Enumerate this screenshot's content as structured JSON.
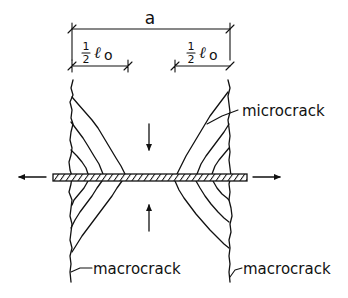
{
  "figure": {
    "type": "crack-pattern-schematic",
    "dimensions": {
      "total_width_label": "a",
      "left_zone": {
        "numerator": "1",
        "denominator": "2",
        "symbol": "ℓ",
        "subscript": "o"
      },
      "right_zone": {
        "numerator": "1",
        "denominator": "2",
        "symbol": "ℓ",
        "subscript": "o"
      }
    },
    "labels": {
      "microcrack": "microcrack",
      "macrocrack_left": "macrocrack",
      "macrocrack_right": "macrocrack"
    },
    "loads": {
      "tension": [
        "left",
        "right"
      ],
      "compression": [
        "down",
        "up"
      ]
    },
    "colors": {
      "ink": "#111111",
      "background": "#ffffff"
    }
  }
}
